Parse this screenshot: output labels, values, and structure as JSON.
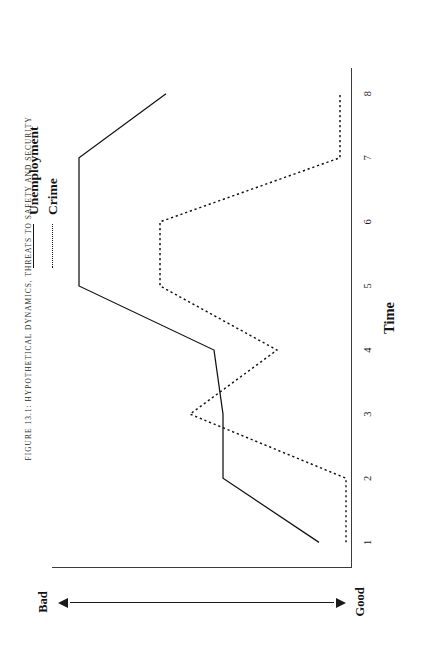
{
  "figure": {
    "caption": "FIGURE 13.1: HYPOTHETICAL DYNAMICS, THREATS TO SAFETY AND SECURITY"
  },
  "legend": {
    "position": "top-right",
    "items": [
      {
        "label": "Unemployment",
        "style": "solid"
      },
      {
        "label": "Crime",
        "style": "dotted"
      }
    ]
  },
  "axes": {
    "x_label": "Time",
    "y_label": "Condition",
    "y_low_label": "Good",
    "y_high_label": "Bad",
    "x_ticks": [
      "1",
      "2",
      "3",
      "4",
      "5",
      "6",
      "7",
      "8"
    ]
  },
  "colors": {
    "line": "#111111",
    "axis": "#3b3b3b",
    "background": "#ffffff",
    "text": "#141414"
  },
  "chart_data": {
    "type": "line",
    "title": "FIGURE 13.1: HYPOTHETICAL DYNAMICS, THREATS TO SAFETY AND SECURITY",
    "xlabel": "Time",
    "ylabel": "Condition",
    "x": [
      1,
      2,
      3,
      4,
      5,
      6,
      7,
      8
    ],
    "xlim": [
      0.6,
      8.4
    ],
    "ylim": [
      0,
      10
    ],
    "y_axis_note": "Unlabeled ordinal scale; low = Good, high = Bad",
    "grid": false,
    "legend": "top-right",
    "series": [
      {
        "name": "Unemployment",
        "style": "solid",
        "values": [
          1.1,
          4.3,
          4.3,
          4.6,
          9.1,
          9.1,
          9.1,
          6.2
        ]
      },
      {
        "name": "Crime",
        "style": "dotted",
        "values": [
          0.2,
          0.2,
          5.4,
          2.5,
          6.4,
          6.4,
          0.4,
          0.4
        ]
      }
    ]
  }
}
